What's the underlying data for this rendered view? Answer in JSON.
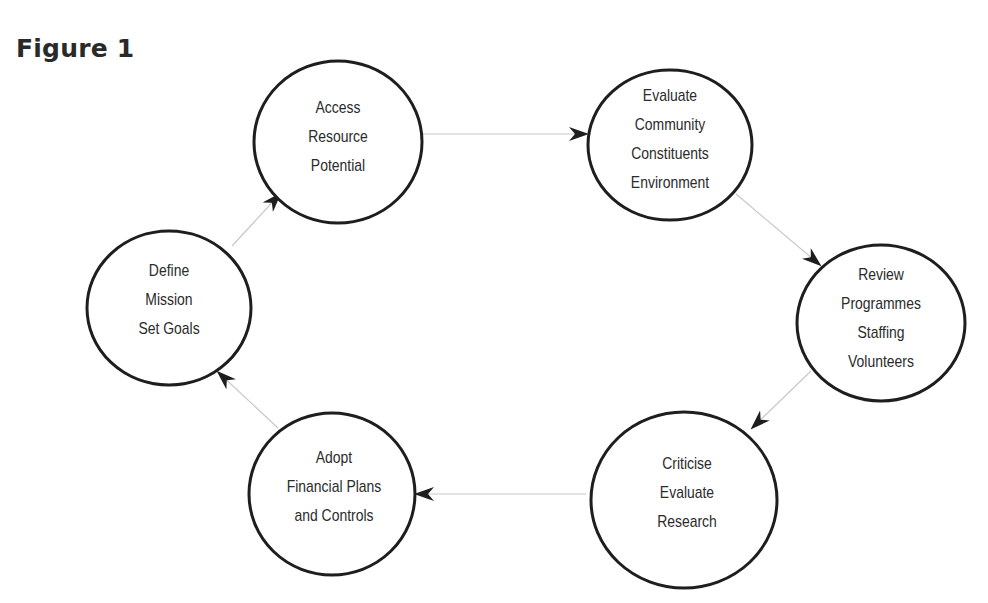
{
  "figure": {
    "title": "Figure 1"
  },
  "colors": {
    "circle_stroke": "#1e1e1e",
    "arrow_line": "#c8c8c8",
    "arrow_head": "#1e1e1e",
    "text": "#2b2b2b"
  },
  "nodes": [
    {
      "id": "access",
      "lines": [
        "Access",
        "Resource",
        "Potential"
      ],
      "cx": 338,
      "cy": 142,
      "r": 82
    },
    {
      "id": "evaluate",
      "lines": [
        "Evaluate",
        "Community",
        "Constituents",
        "Environment"
      ],
      "cx": 670,
      "cy": 145,
      "r": 82
    },
    {
      "id": "review",
      "lines": [
        "Review",
        "Programmes",
        "Staffing",
        "Volunteers"
      ],
      "cx": 880,
      "cy": 323,
      "r": 82
    },
    {
      "id": "criticise",
      "lines": [
        "Criticise",
        "Evaluate",
        "Research"
      ],
      "cx": 684,
      "cy": 500,
      "r": 90
    },
    {
      "id": "adopt",
      "lines": [
        "Adopt",
        "Financial Plans",
        "and Controls"
      ],
      "cx": 332,
      "cy": 494,
      "r": 82
    },
    {
      "id": "define",
      "lines": [
        "Define",
        "Mission",
        "Set Goals"
      ],
      "cx": 169,
      "cy": 308,
      "r": 80
    }
  ],
  "edges": [
    {
      "from": "access",
      "to": "evaluate"
    },
    {
      "from": "evaluate",
      "to": "review"
    },
    {
      "from": "review",
      "to": "criticise"
    },
    {
      "from": "criticise",
      "to": "adopt"
    },
    {
      "from": "adopt",
      "to": "define"
    },
    {
      "from": "define",
      "to": "access"
    }
  ]
}
